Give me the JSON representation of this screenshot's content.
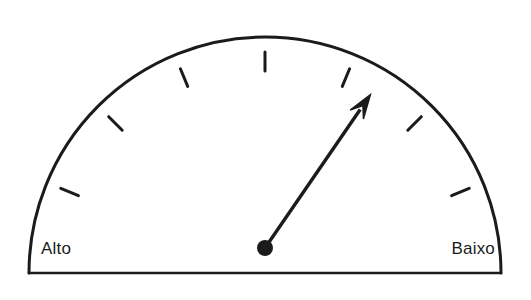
{
  "figure": {
    "type": "gauge-dial",
    "title": "",
    "background_color": "#ffffff",
    "stroke_color": "#1b1b1b"
  },
  "gauge": {
    "left_label": "Alto",
    "right_label": "Baixo",
    "needle_label": "gauge-needle",
    "pivot_label": "gauge-pivot",
    "arc_label": "gauge-arc",
    "baseline_label": "gauge-baseline",
    "geometry": {
      "center_x": 265,
      "center_y": 273,
      "radius": 236,
      "start_angle_deg": 180,
      "end_angle_deg": 0,
      "needle_angle_deg": 55.5,
      "needle_length": 186,
      "pivot_radius": 8,
      "tick_count": 7,
      "tick_length": 19,
      "stroke_width": 3
    },
    "ticks": [
      {
        "angle_deg": 157.5
      },
      {
        "angle_deg": 135
      },
      {
        "angle_deg": 112.5
      },
      {
        "angle_deg": 90
      },
      {
        "angle_deg": 67.5
      },
      {
        "angle_deg": 45
      },
      {
        "angle_deg": 22.5
      }
    ]
  },
  "chart_data": {
    "type": "gauge",
    "title": "",
    "xlabel": "",
    "ylabel": "",
    "categories": [
      "Alto",
      "Baixo"
    ],
    "axis_min_label": "Alto",
    "axis_max_label": "Baixo",
    "scale_start_angle_deg": 180,
    "scale_end_angle_deg": 0,
    "tick_angles_deg": [
      157.5,
      135,
      112.5,
      90,
      67.5,
      45,
      22.5
    ],
    "needle_angle_deg": 55.5,
    "needle_value_fraction": 0.692,
    "grid": false,
    "legend": "none",
    "annotations": [
      "Alto",
      "Baixo"
    ]
  }
}
